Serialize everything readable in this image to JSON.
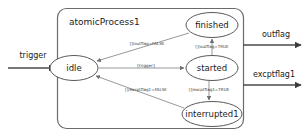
{
  "diagram": {
    "type": "state-machine",
    "container": {
      "title": "atomicProcess1"
    },
    "nodes": [
      {
        "id": "idle",
        "label": "idle",
        "cx": 74,
        "cy": 68,
        "rx": 24,
        "ry": 12.5
      },
      {
        "id": "finished",
        "label": "finished",
        "cx": 212,
        "cy": 25,
        "rx": 26,
        "ry": 12.5
      },
      {
        "id": "started",
        "label": "started",
        "cx": 212,
        "cy": 68,
        "rx": 26,
        "ry": 12.5
      },
      {
        "id": "interrupted1",
        "label": "interrupted1",
        "cx": 212,
        "cy": 114,
        "rx": 30,
        "ry": 12.5
      }
    ],
    "edges": [
      {
        "id": "idle-to-started",
        "from": "idle",
        "to": "started",
        "label": "{trigger}",
        "label_x": 146,
        "label_y": 67
      },
      {
        "id": "started-to-finished",
        "from": "started",
        "to": "finished",
        "label": "[]/outflag=TRUE",
        "label_x": 211,
        "label_y": 45
      },
      {
        "id": "finished-to-idle",
        "from": "finished",
        "to": "idle",
        "label": "[]/outflag=FALSE",
        "label_x": 147,
        "label_y": 45
      },
      {
        "id": "started-to-interrupted1",
        "from": "started",
        "to": "interrupted1",
        "label": "[]/excptflag1=TRUE",
        "label_x": 209,
        "label_y": 89
      },
      {
        "id": "interrupted1-to-idle",
        "from": "interrupted1",
        "to": "idle",
        "label": "[]/excptflag1=FALSE",
        "label_x": 146,
        "label_y": 89
      }
    ],
    "ports": [
      {
        "id": "trigger",
        "label": "trigger",
        "direction": "in",
        "label_x": 33,
        "label_y": 55
      },
      {
        "id": "outflag",
        "label": "outflag",
        "direction": "out",
        "label_x": 276,
        "label_y": 37
      },
      {
        "id": "excptflag1",
        "label": "excptflag1",
        "direction": "out",
        "label_x": 274,
        "label_y": 76
      }
    ],
    "colors": {
      "background": "#ffffff",
      "node_stroke": "#5a5a5a",
      "container_stroke": "#6b6b6b",
      "edge_stroke": "#8c8c8c",
      "io_stroke": "#4a4a4a",
      "text": "#1b1b1b"
    }
  }
}
